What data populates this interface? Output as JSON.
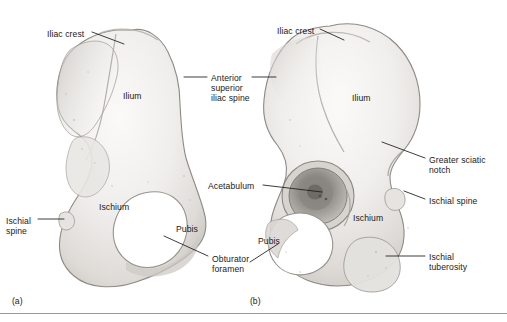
{
  "figure": {
    "background_color": "#ffffff",
    "text_color": "#1a1a1a",
    "leader_color": "#1a1a1a",
    "rule_color": "#9a9a9a",
    "bone_fill_light": "#f4f3f1",
    "bone_fill_mid": "#e2e0dd",
    "bone_fill_shadow": "#bfbcb8",
    "bone_outline": "#8d8a86"
  },
  "panels": [
    {
      "id": "panel-a",
      "letter": "(a)",
      "view": "medial",
      "x": 12,
      "y": 296
    },
    {
      "id": "panel-b",
      "letter": "(b)",
      "view": "lateral",
      "x": 250,
      "y": 296
    }
  ],
  "labels": [
    {
      "id": "iliac-crest-a",
      "text": "Iliac crest",
      "lines": [
        "Iliac crest"
      ],
      "panel": "a",
      "x": 47,
      "y": 29,
      "align": "left"
    },
    {
      "id": "ilium-a",
      "text": "Ilium",
      "lines": [
        "Ilium"
      ],
      "panel": "a",
      "x": 123,
      "y": 91,
      "align": "left"
    },
    {
      "id": "anterior-superior-iliac-spine",
      "text": "Anterior superior iliac spine",
      "lines": [
        "Anterior",
        "superior",
        "iliac spine"
      ],
      "panel": "shared",
      "x": 211,
      "y": 73,
      "align": "left"
    },
    {
      "id": "ischium-a",
      "text": "Ischium",
      "lines": [
        "Ischium"
      ],
      "panel": "a",
      "x": 99,
      "y": 202,
      "align": "left"
    },
    {
      "id": "pubis-a",
      "text": "Pubis",
      "lines": [
        "Pubis"
      ],
      "panel": "a",
      "x": 176,
      "y": 224,
      "align": "left"
    },
    {
      "id": "ischial-spine-a",
      "text": "Ischial spine",
      "lines": [
        "Ischial",
        "spine"
      ],
      "panel": "a",
      "x": 6,
      "y": 216,
      "align": "left"
    },
    {
      "id": "obturator-foramen",
      "text": "Obturator foramen",
      "lines": [
        "Obturator",
        "foramen"
      ],
      "panel": "a",
      "x": 212,
      "y": 254,
      "align": "left"
    },
    {
      "id": "iliac-crest-b",
      "text": "Iliac crest",
      "lines": [
        "Iliac crest"
      ],
      "panel": "b",
      "x": 277,
      "y": 26,
      "align": "left"
    },
    {
      "id": "ilium-b",
      "text": "Ilium",
      "lines": [
        "Ilium"
      ],
      "panel": "b",
      "x": 352,
      "y": 93,
      "align": "left"
    },
    {
      "id": "greater-sciatic-notch",
      "text": "Greater sciatic notch",
      "lines": [
        "Greater sciatic",
        "notch"
      ],
      "panel": "b",
      "x": 429,
      "y": 155,
      "align": "left"
    },
    {
      "id": "acetabulum",
      "text": "Acetabulum",
      "lines": [
        "Acetabulum"
      ],
      "panel": "b",
      "x": 208,
      "y": 181,
      "align": "left"
    },
    {
      "id": "ischial-spine-b",
      "text": "Ischial spine",
      "lines": [
        "Ischial spine"
      ],
      "panel": "b",
      "x": 429,
      "y": 196,
      "align": "left"
    },
    {
      "id": "ischium-b",
      "text": "Ischium",
      "lines": [
        "Ischium"
      ],
      "panel": "b",
      "x": 353,
      "y": 213,
      "align": "left"
    },
    {
      "id": "pubis-b",
      "text": "Pubis",
      "lines": [
        "Pubis"
      ],
      "panel": "b",
      "x": 258,
      "y": 236,
      "align": "left"
    },
    {
      "id": "ischial-tuberosity",
      "text": "Ischial tuberosity",
      "lines": [
        "Ischial",
        "tuberosity"
      ],
      "panel": "b",
      "x": 429,
      "y": 252,
      "align": "left"
    }
  ],
  "structures_depicted": [
    "ilium",
    "ischium",
    "pubis",
    "iliac crest",
    "anterior superior iliac spine",
    "acetabulum",
    "obturator foramen",
    "ischial spine",
    "ischial tuberosity",
    "greater sciatic notch"
  ]
}
